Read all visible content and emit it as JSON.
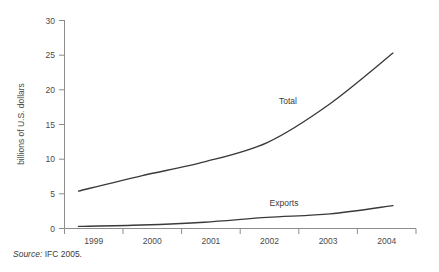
{
  "figure": {
    "source_prefix": "Source:",
    "source_text": " IFC 2005."
  },
  "chart_data": {
    "type": "line",
    "title": "",
    "xlabel": "",
    "ylabel": "billions of U.S. dollars",
    "categories": [
      "1999",
      "2000",
      "2001",
      "2002",
      "2003",
      "2004"
    ],
    "x": [
      1999,
      2000,
      2001,
      2002,
      2003,
      2004
    ],
    "ylim": [
      0,
      30
    ],
    "yticks": [
      0,
      5,
      10,
      15,
      20,
      25,
      30
    ],
    "ytick_labels": [
      "0",
      "5",
      "10",
      "15",
      "20",
      "25",
      "30"
    ],
    "grid": false,
    "legend_position": "inline-annotations",
    "series": [
      {
        "name": "Total",
        "label": "Total",
        "color": "#3a3a3a",
        "values": [
          5.4,
          7.6,
          9.6,
          12.4,
          18.0,
          25.3
        ]
      },
      {
        "name": "Exports",
        "label": "Exports",
        "color": "#3a3a3a",
        "values": [
          0.3,
          0.5,
          0.9,
          1.6,
          2.1,
          3.3
        ]
      }
    ],
    "annotations": [
      {
        "text": "Total",
        "x": 2002.1,
        "y": 20.2
      },
      {
        "text": "Exports",
        "x": 2002.0,
        "y": 4.0
      }
    ]
  }
}
